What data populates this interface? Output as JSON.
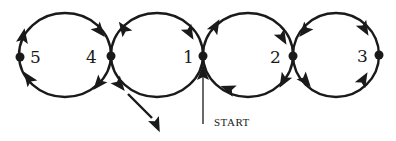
{
  "diagram": {
    "title": "",
    "colors": {
      "ink": "#1a1a1a",
      "background": "#ffffff"
    },
    "loops": [
      {
        "id": "loop-5-4",
        "cx": 65,
        "cy": 55,
        "rx": 46,
        "ry": 42
      },
      {
        "id": "loop-4-1",
        "cx": 157,
        "cy": 55,
        "rx": 46,
        "ry": 42
      },
      {
        "id": "loop-1-2",
        "cx": 248,
        "cy": 55,
        "rx": 45,
        "ry": 42
      },
      {
        "id": "loop-2-3",
        "cx": 336,
        "cy": 55,
        "rx": 43,
        "ry": 42
      }
    ],
    "nodes": [
      {
        "id": "5",
        "label": "5",
        "x": 20,
        "y": 57,
        "lx": 30,
        "ly": 63
      },
      {
        "id": "4",
        "label": "4",
        "x": 111,
        "y": 56,
        "lx": 86,
        "ly": 63
      },
      {
        "id": "1",
        "label": "1",
        "x": 203,
        "y": 56,
        "lx": 183,
        "ly": 63
      },
      {
        "id": "2",
        "label": "2",
        "x": 293,
        "y": 56,
        "lx": 270,
        "ly": 63
      },
      {
        "id": "3",
        "label": "3",
        "x": 379,
        "y": 55,
        "lx": 357,
        "ly": 62
      }
    ],
    "arrows": [
      {
        "x": 23,
        "y": 37,
        "angle": -80
      },
      {
        "x": 29,
        "y": 79,
        "angle": -125
      },
      {
        "x": 99,
        "y": 30,
        "angle": 50
      },
      {
        "x": 99,
        "y": 83,
        "angle": 130
      },
      {
        "x": 124,
        "y": 29,
        "angle": -125
      },
      {
        "x": 119,
        "y": 84,
        "angle": 50
      },
      {
        "x": 189,
        "y": 32,
        "angle": 60
      },
      {
        "x": 215,
        "y": 27,
        "angle": -60
      },
      {
        "x": 229,
        "y": 89,
        "angle": 200
      },
      {
        "x": 203,
        "y": 74,
        "angle": -90
      },
      {
        "x": 282,
        "y": 37,
        "angle": 60
      },
      {
        "x": 284,
        "y": 80,
        "angle": 120
      },
      {
        "x": 305,
        "y": 30,
        "angle": 130
      },
      {
        "x": 305,
        "y": 80,
        "angle": 50
      },
      {
        "x": 364,
        "y": 28,
        "angle": 60
      },
      {
        "x": 363,
        "y": 80,
        "angle": -60
      },
      {
        "x": 156,
        "y": 124,
        "angle": 65
      }
    ],
    "exit_path": {
      "from_x": 128,
      "from_y": 94,
      "to_x": 152,
      "to_y": 118
    },
    "start": {
      "label": "START",
      "line_x": 203,
      "line_top": 62,
      "line_bottom": 124,
      "text_x": 214,
      "text_y": 126
    }
  }
}
